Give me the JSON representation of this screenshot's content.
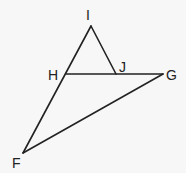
{
  "diagram": {
    "type": "geometry",
    "points": {
      "I": {
        "label": "I",
        "x": 91,
        "y": 26
      },
      "H": {
        "label": "H",
        "x": 66,
        "y": 74
      },
      "J": {
        "label": "J",
        "x": 116,
        "y": 74
      },
      "G": {
        "label": "G",
        "x": 163,
        "y": 74
      },
      "F": {
        "label": "F",
        "x": 23,
        "y": 153
      }
    },
    "segments": [
      {
        "from": "I",
        "to": "F"
      },
      {
        "from": "I",
        "to": "J"
      },
      {
        "from": "H",
        "to": "G"
      },
      {
        "from": "F",
        "to": "G"
      }
    ],
    "labels": {
      "I": "I",
      "H": "H",
      "J": "J",
      "G": "G",
      "F": "F"
    },
    "colors": {
      "line": "#222222",
      "background": "#f7f7f7"
    }
  }
}
